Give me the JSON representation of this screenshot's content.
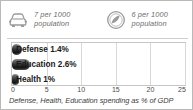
{
  "legend": {
    "items": [
      {
        "icon": "car-icon",
        "label": "7 per 1000\npopulation"
      },
      {
        "icon": "circle-slash-icon",
        "label": "6 per 1000\npopulation"
      }
    ]
  },
  "caption": "Defense, Health, Education spending as % of GDP",
  "colors": {
    "bar": "#2e2e2e",
    "grid": "#d8d8d8",
    "frame": "#c6c6c6",
    "border": "#b9b9b9",
    "legend_text": "#6d6d6d"
  },
  "chart_data": {
    "type": "bar",
    "orientation": "horizontal",
    "title": "",
    "subtitle": "",
    "xlabel": "Defense, Health, Education spending as % of GDP",
    "ylabel": "",
    "categories": [
      "Defense",
      "Education",
      "Health"
    ],
    "values": [
      1.4,
      2.6,
      1
    ],
    "data_labels": [
      "Defense 1.4%",
      "Education 2.6%",
      "Health 1%"
    ],
    "xlim": [
      0,
      25
    ],
    "xticks": [
      0,
      5,
      10,
      15,
      20,
      25
    ],
    "xtick_labels": [
      "0",
      "5",
      "10",
      "15",
      "20",
      "25"
    ],
    "grid": true,
    "grid_axis": "x",
    "legend_position": "top",
    "legend_entries": [
      "7 per 1000 population",
      "6 per 1000 population"
    ]
  }
}
